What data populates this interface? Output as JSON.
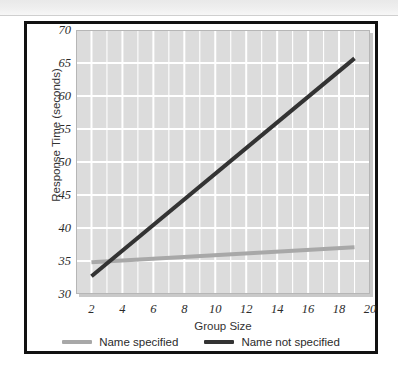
{
  "figure": {
    "frame_color": "#111111",
    "background": "#ffffff"
  },
  "chart_data": {
    "type": "line",
    "title": "",
    "xlabel": "Group Size",
    "ylabel": "Response Time (seconds)",
    "xlim": [
      1,
      20
    ],
    "ylim": [
      30,
      70
    ],
    "xticks": [
      2,
      4,
      6,
      8,
      10,
      12,
      14,
      16,
      18,
      20
    ],
    "yticks": [
      30,
      35,
      40,
      45,
      50,
      55,
      60,
      65,
      70
    ],
    "xtick_labels": [
      "2",
      "4",
      "6",
      "8",
      "10",
      "12",
      "14",
      "16",
      "18",
      "20"
    ],
    "ytick_labels": [
      "30",
      "35",
      "40",
      "45",
      "50",
      "55",
      "60",
      "65",
      "70"
    ],
    "grid": true,
    "grid_color": "#ffffff",
    "plot_background": "#dcdcdc",
    "legend_position": "below",
    "series": [
      {
        "name": "Name specified",
        "color": "#a8a8a8",
        "x": [
          2,
          19
        ],
        "y": [
          34.8,
          37.1
        ]
      },
      {
        "name": "Name not specified",
        "color": "#333333",
        "x": [
          2,
          19
        ],
        "y": [
          32.7,
          65.7
        ]
      }
    ]
  },
  "legend": {
    "items": [
      {
        "label": "Name specified",
        "color": "#a8a8a8"
      },
      {
        "label": "Name not specified",
        "color": "#333333"
      }
    ]
  }
}
